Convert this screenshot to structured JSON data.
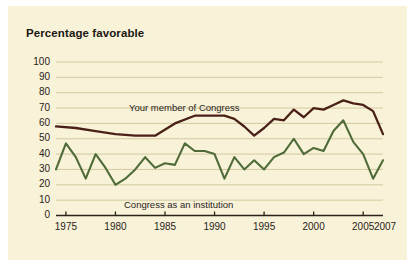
{
  "figure": {
    "background_color": "#f7f2d8",
    "page_color": "#ffffff"
  },
  "title": "Percentage favorable",
  "series_labels": {
    "member": "Your member of Congress",
    "institution": "Congress as an institution"
  },
  "axis": {
    "y_ticks": [
      "100",
      "90",
      "80",
      "70",
      "60",
      "50",
      "40",
      "30",
      "20",
      "10",
      "0"
    ],
    "x_ticks": [
      "1975",
      "1980",
      "1985",
      "1990",
      "1995",
      "2000",
      "2005"
    ],
    "x_end_label": "2007"
  },
  "chart_data": {
    "type": "line",
    "title": "Percentage favorable",
    "xlabel": "",
    "ylabel": "Percentage favorable",
    "ylim": [
      0,
      100
    ],
    "xlim": [
      1974,
      2007
    ],
    "ytick_values": [
      0,
      10,
      20,
      30,
      40,
      50,
      60,
      70,
      80,
      90,
      100
    ],
    "xtick_values": [
      1975,
      1980,
      1985,
      1990,
      1995,
      2000,
      2005
    ],
    "xtick_extra": [
      2007
    ],
    "grid": "horizontal",
    "legend": "inline-annotations",
    "colors": {
      "member": "#4a2018",
      "institution": "#4e6b38",
      "gridline": "#cfc49a",
      "axis": "#2a2318"
    },
    "series": [
      {
        "name": "Your member of Congress",
        "color": "#4a2018",
        "x": [
          1974,
          1976,
          1978,
          1980,
          1982,
          1984,
          1986,
          1988,
          1990,
          1991,
          1992,
          1993,
          1994,
          1995,
          1996,
          1997,
          1998,
          1999,
          2000,
          2001,
          2002,
          2003,
          2004,
          2005,
          2006,
          2007
        ],
        "values": [
          58,
          57,
          55,
          53,
          52,
          52,
          60,
          65,
          65,
          65,
          63,
          58,
          52,
          57,
          63,
          62,
          69,
          64,
          70,
          69,
          72,
          75,
          73,
          72,
          68,
          53
        ]
      },
      {
        "name": "Congress as an institution",
        "color": "#4e6b38",
        "x": [
          1974,
          1975,
          1976,
          1977,
          1978,
          1979,
          1980,
          1981,
          1982,
          1983,
          1984,
          1985,
          1986,
          1987,
          1988,
          1989,
          1990,
          1991,
          1992,
          1993,
          1994,
          1995,
          1996,
          1997,
          1998,
          1999,
          2000,
          2001,
          2002,
          2003,
          2004,
          2005,
          2006,
          2007
        ],
        "values": [
          30,
          47,
          38,
          24,
          40,
          31,
          20,
          24,
          30,
          38,
          31,
          34,
          33,
          47,
          42,
          42,
          40,
          24,
          38,
          30,
          36,
          30,
          38,
          41,
          50,
          40,
          44,
          42,
          55,
          62,
          48,
          40,
          24,
          36
        ]
      }
    ]
  }
}
